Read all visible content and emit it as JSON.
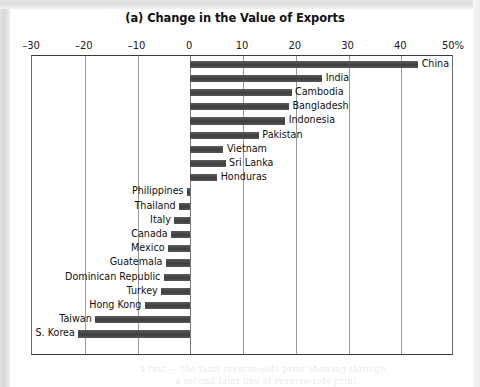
{
  "figure": {
    "title": "(a) Change in the Value of Exports",
    "frame_color": "#3a3a3a",
    "bar_color": "#4a4a4a"
  },
  "axis": {
    "ticks": [
      {
        "value": -30,
        "label": "–30"
      },
      {
        "value": -20,
        "label": "–20"
      },
      {
        "value": -10,
        "label": "–10"
      },
      {
        "value": 0,
        "label": "0"
      },
      {
        "value": 10,
        "label": "10"
      },
      {
        "value": 20,
        "label": "20"
      },
      {
        "value": 30,
        "label": "30"
      },
      {
        "value": 40,
        "label": "40"
      },
      {
        "value": 50,
        "label": "50%"
      }
    ]
  },
  "chart_data": {
    "type": "bar",
    "orientation": "horizontal",
    "title": "(a) Change in the Value of Exports",
    "xlabel": "",
    "ylabel": "",
    "xlim": [
      -30,
      50
    ],
    "xticks": [
      -30,
      -20,
      -10,
      0,
      10,
      20,
      30,
      40,
      50
    ],
    "xtick_labels": [
      "–30",
      "–20",
      "–10",
      "0",
      "10",
      "20",
      "30",
      "40",
      "50%"
    ],
    "grid": "vertical",
    "legend": "none",
    "units": "percent",
    "categories": [
      "China",
      "India",
      "Cambodia",
      "Bangladesh",
      "Indonesia",
      "Pakistan",
      "Vietnam",
      "Sri Lanka",
      "Honduras",
      "Philippines",
      "Thailand",
      "Italy",
      "Canada",
      "Mexico",
      "Guatemala",
      "Dominican Republic",
      "Turkey",
      "Hong Kong",
      "Taiwan",
      "S. Korea"
    ],
    "values": [
      43.2,
      25.0,
      19.2,
      18.7,
      18.0,
      13.0,
      6.3,
      6.7,
      5.1,
      -0.6,
      -2.1,
      -3.0,
      -3.6,
      -4.2,
      -4.6,
      -5.0,
      -5.5,
      -8.6,
      -18.0,
      -21.2
    ]
  },
  "ghost_text": {
    "line1": "a text — the faint reverse-side print showing through",
    "line2": "a second faint line of reverse-side print"
  }
}
